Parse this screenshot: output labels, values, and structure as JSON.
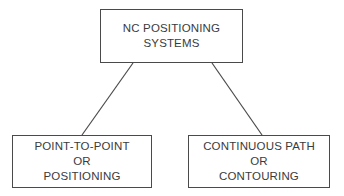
{
  "diagram": {
    "type": "hierarchy-tree",
    "background_color": "#ffffff",
    "line_color": "#4a4a4a",
    "text_color": "#3b3b3b",
    "root": {
      "id": "nc-positioning-systems",
      "lines": [
        "NC POSITIONING",
        "SYSTEMS"
      ],
      "full_text": "NC POSITIONING SYSTEMS"
    },
    "children": [
      {
        "id": "point-to-point",
        "lines": [
          "POINT-TO-POINT",
          "OR",
          "POSITIONING"
        ],
        "full_text": "POINT-TO-POINT OR POSITIONING"
      },
      {
        "id": "continuous-path",
        "lines": [
          "CONTINUOUS PATH",
          "OR",
          "CONTOURING"
        ],
        "full_text": "CONTINUOUS PATH OR CONTOURING"
      }
    ],
    "connectors": [
      {
        "id": "root-to-point-to-point",
        "x1": 133,
        "y1": 63,
        "x2": 82,
        "y2": 135
      },
      {
        "id": "root-to-continuous-path",
        "x1": 212,
        "y1": 63,
        "x2": 262,
        "y2": 135
      }
    ]
  }
}
